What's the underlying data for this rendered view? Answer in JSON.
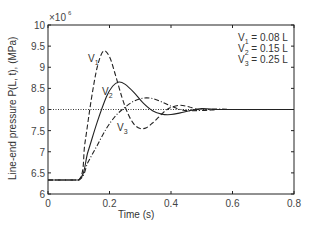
{
  "chart_data": {
    "type": "line",
    "title": "",
    "xlabel": "Time (s)",
    "ylabel": "Line-end pressure P(L, t), (MPa)",
    "y_multiplier": "×10^6",
    "xlim": [
      0,
      0.8
    ],
    "ylim": [
      6,
      10
    ],
    "x_ticks": [
      "0",
      "0.2",
      "0.4",
      "0.6",
      "0.8"
    ],
    "y_ticks": [
      "6",
      "6.5",
      "7",
      "7.5",
      "8",
      "8.5",
      "9",
      "9.5",
      "10"
    ],
    "grid": false,
    "reference_line": {
      "y": 8,
      "style": "dotted"
    },
    "legend": [
      "V1 = 0.08 L",
      "V2 = 0.15 L",
      "V3 = 0.25 L"
    ],
    "legend_position": "top-right (text only)",
    "curve_labels": [
      "V1",
      "V2",
      "V3"
    ],
    "series": [
      {
        "name": "V1 = 0.08 L",
        "style": "dashed",
        "x": [
          0,
          0.1,
          0.12,
          0.14,
          0.16,
          0.18,
          0.2,
          0.22,
          0.24,
          0.26,
          0.28,
          0.3,
          0.32,
          0.34,
          0.36,
          0.38,
          0.4,
          0.43,
          0.46,
          0.5,
          0.55,
          0.6,
          0.7,
          0.8
        ],
        "values": [
          6.33,
          6.33,
          7.2,
          8.2,
          9.0,
          9.38,
          9.25,
          8.8,
          8.3,
          7.9,
          7.65,
          7.55,
          7.57,
          7.68,
          7.82,
          7.96,
          8.05,
          8.1,
          8.06,
          7.98,
          8.0,
          8.0,
          8.0,
          8.0
        ]
      },
      {
        "name": "V2 = 0.15 L",
        "style": "solid",
        "x": [
          0,
          0.1,
          0.13,
          0.16,
          0.19,
          0.21,
          0.23,
          0.25,
          0.28,
          0.31,
          0.34,
          0.37,
          0.4,
          0.43,
          0.46,
          0.5,
          0.55,
          0.6,
          0.7,
          0.8
        ],
        "values": [
          6.33,
          6.33,
          7.0,
          7.7,
          8.3,
          8.55,
          8.65,
          8.6,
          8.4,
          8.15,
          7.97,
          7.89,
          7.88,
          7.92,
          7.97,
          8.02,
          8.0,
          8.0,
          8.0,
          8.0
        ]
      },
      {
        "name": "V3 = 0.25 L",
        "style": "dash-dot",
        "x": [
          0,
          0.1,
          0.13,
          0.16,
          0.19,
          0.22,
          0.25,
          0.28,
          0.31,
          0.34,
          0.37,
          0.4,
          0.43,
          0.46,
          0.5,
          0.55,
          0.6,
          0.7,
          0.8
        ],
        "values": [
          6.33,
          6.33,
          6.75,
          7.15,
          7.55,
          7.85,
          8.05,
          8.2,
          8.27,
          8.26,
          8.18,
          8.08,
          8.0,
          7.97,
          7.98,
          8.01,
          8.0,
          8.0,
          8.0
        ]
      }
    ]
  }
}
